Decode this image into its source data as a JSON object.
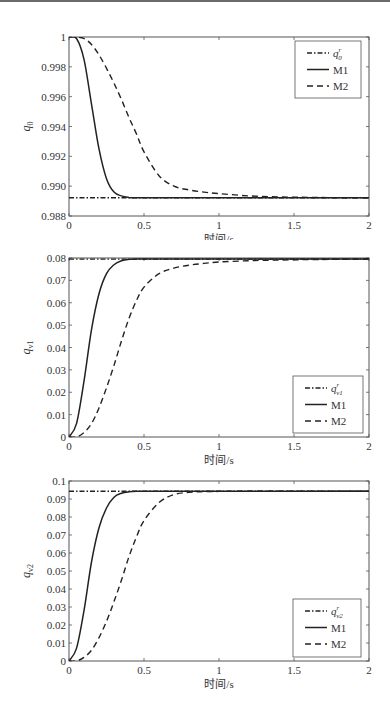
{
  "chart_data": [
    {
      "type": "line",
      "title": "",
      "xlabel": "时间/s",
      "ylabel": "q0",
      "ylabel_display": {
        "base": "q",
        "sub": "0"
      },
      "xlim": [
        0,
        2
      ],
      "ylim": [
        0.988,
        1.0
      ],
      "xticks": [
        "0",
        "0.5",
        "1",
        "1.5",
        "2"
      ],
      "yticks": [
        "0.988",
        "0.990",
        "0.992",
        "0.994",
        "0.996",
        "0.998",
        "1"
      ],
      "grid": false,
      "legend_position": "upper right",
      "legend": [
        "q0^r",
        "M1",
        "M2"
      ],
      "legend_display": [
        {
          "base": "q",
          "sub": "0",
          "sup": "r"
        },
        {
          "text": "M1"
        },
        {
          "text": "M2"
        }
      ],
      "x": [
        0,
        0.05,
        0.1,
        0.15,
        0.2,
        0.25,
        0.3,
        0.35,
        0.4,
        0.45,
        0.5,
        0.6,
        0.7,
        0.8,
        0.9,
        1.0,
        1.2,
        1.4,
        1.6,
        1.8,
        2.0
      ],
      "series": [
        {
          "name": "q0^r",
          "style": "dashdot",
          "values": [
            0.98922,
            0.98922,
            0.98922,
            0.98922,
            0.98922,
            0.98922,
            0.98922,
            0.98922,
            0.98922,
            0.98922,
            0.98922,
            0.98922,
            0.98922,
            0.98922,
            0.98922,
            0.98922,
            0.98922,
            0.98922,
            0.98922,
            0.98922,
            0.98922
          ]
        },
        {
          "name": "M1",
          "style": "solid",
          "values": [
            1.0,
            0.9999,
            0.9985,
            0.9955,
            0.9925,
            0.9905,
            0.9896,
            0.98935,
            0.98925,
            0.98922,
            0.98922,
            0.98922,
            0.98922,
            0.98922,
            0.98922,
            0.98922,
            0.98922,
            0.98922,
            0.98922,
            0.98922,
            0.98922
          ]
        },
        {
          "name": "M2",
          "style": "dashed",
          "values": [
            1.0,
            1.0,
            0.9999,
            0.9995,
            0.9988,
            0.9979,
            0.9969,
            0.9958,
            0.9946,
            0.9935,
            0.9923,
            0.9907,
            0.99,
            0.98975,
            0.9896,
            0.9895,
            0.98935,
            0.98928,
            0.98925,
            0.98923,
            0.98922
          ]
        }
      ]
    },
    {
      "type": "line",
      "title": "",
      "xlabel": "时间/s",
      "ylabel": "qv1",
      "ylabel_display": {
        "base": "q",
        "sub": "v1"
      },
      "xlim": [
        0,
        2
      ],
      "ylim": [
        0,
        0.08
      ],
      "xticks": [
        "0",
        "0.5",
        "1",
        "1.5",
        "2"
      ],
      "yticks": [
        "0",
        "0.01",
        "0.02",
        "0.03",
        "0.04",
        "0.05",
        "0.06",
        "0.07",
        "0.08"
      ],
      "grid": false,
      "legend_position": "lower right",
      "legend": [
        "qv1^r",
        "M1",
        "M2"
      ],
      "legend_display": [
        {
          "base": "q",
          "sub": "v1",
          "sup": "r"
        },
        {
          "text": "M1"
        },
        {
          "text": "M2"
        }
      ],
      "x": [
        0,
        0.05,
        0.1,
        0.15,
        0.2,
        0.25,
        0.3,
        0.35,
        0.4,
        0.45,
        0.5,
        0.6,
        0.7,
        0.8,
        0.9,
        1.0,
        1.2,
        1.4,
        1.6,
        1.8,
        2.0
      ],
      "series": [
        {
          "name": "qv1^r",
          "style": "dashdot",
          "values": [
            0.0795,
            0.0795,
            0.0795,
            0.0795,
            0.0795,
            0.0795,
            0.0795,
            0.0795,
            0.0795,
            0.0795,
            0.0795,
            0.0795,
            0.0795,
            0.0795,
            0.0795,
            0.0795,
            0.0795,
            0.0795,
            0.0795,
            0.0795,
            0.0795
          ]
        },
        {
          "name": "M1",
          "style": "solid",
          "values": [
            0.0,
            0.006,
            0.025,
            0.048,
            0.064,
            0.073,
            0.077,
            0.0788,
            0.0794,
            0.0795,
            0.0795,
            0.0795,
            0.0795,
            0.0795,
            0.0795,
            0.0795,
            0.0795,
            0.0795,
            0.0795,
            0.0795,
            0.0795
          ]
        },
        {
          "name": "M2",
          "style": "dashed",
          "values": [
            0.0,
            0.0,
            0.002,
            0.006,
            0.013,
            0.022,
            0.032,
            0.043,
            0.053,
            0.061,
            0.067,
            0.073,
            0.0755,
            0.0768,
            0.0776,
            0.0782,
            0.0788,
            0.0791,
            0.0793,
            0.0794,
            0.0795
          ]
        }
      ]
    },
    {
      "type": "line",
      "title": "",
      "xlabel": "时间/s",
      "ylabel": "qv2",
      "ylabel_display": {
        "base": "q",
        "sub": "v2"
      },
      "xlim": [
        0,
        2
      ],
      "ylim": [
        0,
        0.1
      ],
      "xticks": [
        "0",
        "0.5",
        "1",
        "1.5",
        "2"
      ],
      "yticks": [
        "0",
        "0.01",
        "0.02",
        "0.03",
        "0.04",
        "0.05",
        "0.06",
        "0.07",
        "0.08",
        "0.09",
        "0.1"
      ],
      "grid": false,
      "legend_position": "lower right",
      "legend": [
        "qv2^r",
        "M1",
        "M2"
      ],
      "legend_display": [
        {
          "base": "q",
          "sub": "v2",
          "sup": "r"
        },
        {
          "text": "M1"
        },
        {
          "text": "M2"
        }
      ],
      "x": [
        0,
        0.05,
        0.1,
        0.15,
        0.2,
        0.25,
        0.3,
        0.35,
        0.4,
        0.45,
        0.5,
        0.6,
        0.7,
        0.8,
        0.9,
        1.0,
        1.2,
        1.4,
        1.6,
        1.8,
        2.0
      ],
      "series": [
        {
          "name": "qv2^r",
          "style": "dashdot",
          "values": [
            0.0943,
            0.0943,
            0.0943,
            0.0943,
            0.0943,
            0.0943,
            0.0943,
            0.0943,
            0.0943,
            0.0943,
            0.0943,
            0.0943,
            0.0943,
            0.0943,
            0.0943,
            0.0943,
            0.0943,
            0.0943,
            0.0943,
            0.0943,
            0.0943
          ]
        },
        {
          "name": "M1",
          "style": "solid",
          "values": [
            0.0,
            0.007,
            0.028,
            0.055,
            0.074,
            0.085,
            0.091,
            0.0932,
            0.094,
            0.0943,
            0.0943,
            0.0943,
            0.0943,
            0.0943,
            0.0943,
            0.0943,
            0.0943,
            0.0943,
            0.0943,
            0.0943,
            0.0943
          ]
        },
        {
          "name": "M2",
          "style": "dashed",
          "values": [
            0.0,
            0.0,
            0.002,
            0.006,
            0.013,
            0.022,
            0.033,
            0.045,
            0.058,
            0.069,
            0.078,
            0.088,
            0.0925,
            0.0937,
            0.0941,
            0.0942,
            0.0943,
            0.0943,
            0.0943,
            0.0943,
            0.0943
          ]
        }
      ]
    }
  ]
}
